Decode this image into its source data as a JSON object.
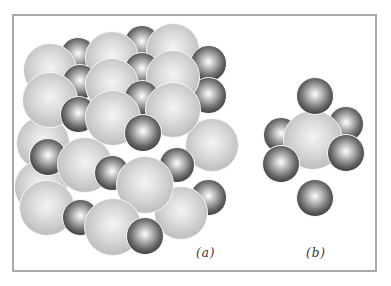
{
  "figure": {
    "labels": {
      "a": "(a)",
      "b": "(b)"
    },
    "colors": {
      "frame": "#a8a8a8",
      "large_ion": "#cfcfcf",
      "small_ion": "#2a2a2a"
    }
  },
  "panel_a": {
    "caption": "(a)",
    "description": "rock-salt crystal lattice: large light spheres and small dark spheres",
    "large_sphere_count": 15,
    "small_sphere_count": 15
  },
  "panel_b": {
    "caption": "(b)",
    "description": "one large sphere octahedrally coordinated by six small dark spheres",
    "large_sphere_count": 1,
    "small_sphere_count": 6
  }
}
